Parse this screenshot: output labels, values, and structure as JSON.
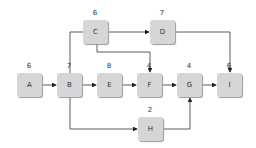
{
  "nodes": [
    {
      "id": "A",
      "duration": "6",
      "x": 17,
      "y": 73
    },
    {
      "id": "B",
      "duration": "7",
      "x": 57,
      "y": 73
    },
    {
      "id": "C",
      "duration": "6",
      "x": 83,
      "y": 20
    },
    {
      "id": "D",
      "duration": "7",
      "x": 150,
      "y": 20
    },
    {
      "id": "E",
      "duration": "8",
      "x": 97,
      "y": 73
    },
    {
      "id": "F",
      "duration": "4",
      "x": 137,
      "y": 73
    },
    {
      "id": "G",
      "duration": "4",
      "x": 177,
      "y": 73
    },
    {
      "id": "H",
      "duration": "2",
      "x": 138,
      "y": 117
    },
    {
      "id": "I",
      "duration": "6",
      "x": 217,
      "y": 73
    }
  ],
  "edges": [
    [
      "A",
      "B"
    ],
    [
      "B",
      "E"
    ],
    [
      "E",
      "F"
    ],
    [
      "F",
      "G"
    ],
    [
      "G",
      "I"
    ],
    [
      "B",
      "C"
    ],
    [
      "C",
      "D"
    ],
    [
      "C",
      "F"
    ],
    [
      "D",
      "I"
    ],
    [
      "B",
      "H"
    ],
    [
      "H",
      "G"
    ]
  ]
}
